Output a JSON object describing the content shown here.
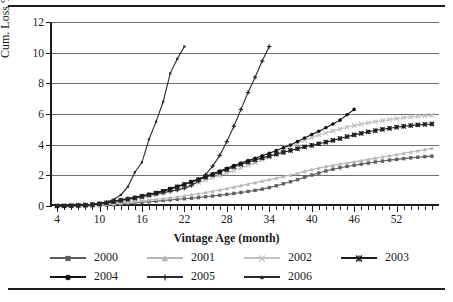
{
  "chart_data": {
    "type": "line",
    "title": "",
    "xlabel": "Vintage Age (month)",
    "ylabel": "Cum. Loss %",
    "xlim": [
      3,
      58
    ],
    "ylim": [
      0,
      12
    ],
    "yticks": [
      0,
      2,
      4,
      6,
      8,
      10,
      12
    ],
    "xticks": [
      4,
      10,
      16,
      22,
      28,
      34,
      40,
      46,
      52
    ],
    "xtick_step_minor": 1,
    "grid": "horizontal",
    "legend_position": "bottom",
    "series": [
      {
        "name": "2000",
        "marker": "square",
        "color": "#5e5e5e",
        "x": [
          4,
          5,
          6,
          7,
          8,
          9,
          10,
          11,
          12,
          13,
          14,
          15,
          16,
          17,
          18,
          19,
          20,
          21,
          22,
          23,
          24,
          25,
          26,
          27,
          28,
          29,
          30,
          31,
          32,
          33,
          34,
          35,
          36,
          37,
          38,
          39,
          40,
          41,
          42,
          43,
          44,
          45,
          46,
          47,
          48,
          49,
          50,
          51,
          52,
          53,
          54,
          55,
          56,
          57
        ],
        "values": [
          0.0,
          0.0,
          0.0,
          0.01,
          0.01,
          0.02,
          0.03,
          0.05,
          0.08,
          0.12,
          0.16,
          0.2,
          0.24,
          0.28,
          0.32,
          0.36,
          0.4,
          0.44,
          0.47,
          0.51,
          0.55,
          0.6,
          0.65,
          0.7,
          0.76,
          0.82,
          0.88,
          0.95,
          1.02,
          1.1,
          1.2,
          1.32,
          1.45,
          1.58,
          1.72,
          1.88,
          2.02,
          2.15,
          2.28,
          2.4,
          2.5,
          2.58,
          2.66,
          2.73,
          2.8,
          2.87,
          2.93,
          2.99,
          3.04,
          3.09,
          3.14,
          3.18,
          3.22,
          3.25
        ]
      },
      {
        "name": "2001",
        "marker": "triangle",
        "color": "#b5b5b5",
        "x": [
          4,
          5,
          6,
          7,
          8,
          9,
          10,
          11,
          12,
          13,
          14,
          15,
          16,
          17,
          18,
          19,
          20,
          21,
          22,
          23,
          24,
          25,
          26,
          27,
          28,
          29,
          30,
          31,
          32,
          33,
          34,
          35,
          36,
          37,
          38,
          39,
          40,
          41,
          42,
          43,
          44,
          45,
          46,
          47,
          48,
          49,
          50,
          51,
          52,
          53,
          54,
          55,
          56,
          57
        ],
        "values": [
          0.0,
          0.0,
          0.01,
          0.01,
          0.02,
          0.03,
          0.05,
          0.09,
          0.14,
          0.19,
          0.24,
          0.29,
          0.34,
          0.39,
          0.44,
          0.49,
          0.54,
          0.6,
          0.66,
          0.73,
          0.8,
          0.88,
          0.96,
          1.05,
          1.14,
          1.23,
          1.33,
          1.43,
          1.53,
          1.62,
          1.72,
          1.82,
          1.92,
          2.02,
          2.14,
          2.26,
          2.38,
          2.48,
          2.57,
          2.65,
          2.73,
          2.8,
          2.88,
          2.96,
          3.04,
          3.12,
          3.2,
          3.28,
          3.36,
          3.44,
          3.52,
          3.6,
          3.68,
          3.76
        ]
      },
      {
        "name": "2002",
        "marker": "x",
        "color": "#c2c2c2",
        "x": [
          4,
          5,
          6,
          7,
          8,
          9,
          10,
          11,
          12,
          13,
          14,
          15,
          16,
          17,
          18,
          19,
          20,
          21,
          22,
          23,
          24,
          25,
          26,
          27,
          28,
          29,
          30,
          31,
          32,
          33,
          34,
          35,
          36,
          37,
          38,
          39,
          40,
          41,
          42,
          43,
          44,
          45,
          46,
          47,
          48,
          49,
          50,
          51,
          52,
          53,
          54,
          55,
          56,
          57
        ],
        "values": [
          0.0,
          0.0,
          0.01,
          0.02,
          0.03,
          0.05,
          0.08,
          0.13,
          0.2,
          0.28,
          0.36,
          0.44,
          0.52,
          0.62,
          0.72,
          0.84,
          0.96,
          1.1,
          1.24,
          1.38,
          1.53,
          1.68,
          1.84,
          2.0,
          2.16,
          2.32,
          2.48,
          2.64,
          2.82,
          3.0,
          3.2,
          3.42,
          3.64,
          3.86,
          4.08,
          4.28,
          4.46,
          4.62,
          4.76,
          4.9,
          5.02,
          5.14,
          5.24,
          5.34,
          5.42,
          5.5,
          5.57,
          5.64,
          5.7,
          5.76,
          5.81,
          5.85,
          5.88,
          5.91
        ]
      },
      {
        "name": "2003",
        "marker": "asterisk",
        "color": "#1c1c1c",
        "x": [
          4,
          5,
          6,
          7,
          8,
          9,
          10,
          11,
          12,
          13,
          14,
          15,
          16,
          17,
          18,
          19,
          20,
          21,
          22,
          23,
          24,
          25,
          26,
          27,
          28,
          29,
          30,
          31,
          32,
          33,
          34,
          35,
          36,
          37,
          38,
          39,
          40,
          41,
          42,
          43,
          44,
          45,
          46,
          47,
          48,
          49,
          50,
          51,
          52,
          53,
          54,
          55,
          56,
          57
        ],
        "values": [
          0.0,
          0.01,
          0.02,
          0.04,
          0.06,
          0.09,
          0.14,
          0.2,
          0.28,
          0.36,
          0.44,
          0.52,
          0.62,
          0.72,
          0.84,
          0.96,
          1.1,
          1.24,
          1.4,
          1.56,
          1.72,
          1.88,
          2.04,
          2.2,
          2.38,
          2.56,
          2.72,
          2.86,
          3.0,
          3.14,
          3.26,
          3.38,
          3.5,
          3.62,
          3.74,
          3.86,
          3.96,
          4.06,
          4.16,
          4.28,
          4.4,
          4.52,
          4.64,
          4.74,
          4.84,
          4.92,
          5.0,
          5.07,
          5.14,
          5.2,
          5.25,
          5.29,
          5.32,
          5.35
        ]
      },
      {
        "name": "2004",
        "marker": "circle",
        "color": "#111111",
        "x": [
          4,
          5,
          6,
          7,
          8,
          9,
          10,
          11,
          12,
          13,
          14,
          15,
          16,
          17,
          18,
          19,
          20,
          21,
          22,
          23,
          24,
          25,
          26,
          27,
          28,
          29,
          30,
          31,
          32,
          33,
          34,
          35,
          36,
          37,
          38,
          39,
          40,
          41,
          42,
          43,
          44,
          45,
          46
        ],
        "values": [
          0.0,
          0.01,
          0.02,
          0.04,
          0.07,
          0.11,
          0.16,
          0.22,
          0.3,
          0.38,
          0.46,
          0.56,
          0.66,
          0.76,
          0.88,
          1.0,
          1.14,
          1.28,
          1.44,
          1.6,
          1.76,
          1.92,
          2.1,
          2.28,
          2.46,
          2.64,
          2.8,
          2.96,
          3.12,
          3.28,
          3.44,
          3.62,
          3.8,
          3.98,
          4.2,
          4.44,
          4.66,
          4.88,
          5.1,
          5.35,
          5.6,
          5.95,
          6.3
        ]
      },
      {
        "name": "2005",
        "marker": "plus",
        "color": "#2a2a2a",
        "x": [
          4,
          5,
          6,
          7,
          8,
          9,
          10,
          11,
          12,
          13,
          14,
          15,
          16,
          17,
          18,
          19,
          20,
          21,
          22,
          23,
          24,
          25,
          26,
          27,
          28,
          29,
          30,
          31,
          32,
          33,
          34
        ],
        "values": [
          0.0,
          0.01,
          0.02,
          0.04,
          0.07,
          0.11,
          0.17,
          0.24,
          0.32,
          0.4,
          0.48,
          0.56,
          0.64,
          0.72,
          0.8,
          0.88,
          0.96,
          1.04,
          1.16,
          1.34,
          1.62,
          2.04,
          2.6,
          3.3,
          4.2,
          5.2,
          6.3,
          7.4,
          8.4,
          9.45,
          10.4
        ]
      },
      {
        "name": "2006",
        "marker": "small-square",
        "color": "#2a2a2a",
        "x": [
          4,
          5,
          6,
          7,
          8,
          9,
          10,
          11,
          12,
          13,
          14,
          15,
          16,
          17,
          18,
          19,
          20,
          21,
          22
        ],
        "values": [
          0.0,
          0.01,
          0.02,
          0.04,
          0.06,
          0.1,
          0.16,
          0.26,
          0.42,
          0.72,
          1.25,
          2.2,
          2.85,
          4.35,
          5.5,
          6.8,
          8.65,
          9.6,
          10.4
        ]
      }
    ]
  },
  "axis": {
    "ylabel": "Cum. Loss %",
    "xlabel": "Vintage Age (month)",
    "ytick_labels": [
      "0",
      "2",
      "4",
      "6",
      "8",
      "10",
      "12"
    ],
    "xtick_labels": [
      "4",
      "10",
      "16",
      "22",
      "28",
      "34",
      "40",
      "46",
      "52"
    ]
  },
  "legend": {
    "rows": [
      [
        {
          "label": "2000",
          "marker": "square",
          "color": "#5e5e5e"
        },
        {
          "label": "2001",
          "marker": "triangle",
          "color": "#b5b5b5"
        },
        {
          "label": "2002",
          "marker": "x",
          "color": "#c2c2c2"
        },
        {
          "label": "2003",
          "marker": "asterisk",
          "color": "#1c1c1c"
        }
      ],
      [
        {
          "label": "2004",
          "marker": "circle",
          "color": "#111111"
        },
        {
          "label": "2005",
          "marker": "plus",
          "color": "#2a2a2a"
        },
        {
          "label": "2006",
          "marker": "small-square",
          "color": "#2a2a2a"
        }
      ]
    ]
  }
}
